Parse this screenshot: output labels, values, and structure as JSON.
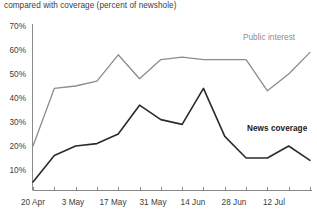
{
  "subtitle": "compared with coverage (percent of newshole)",
  "colors": {
    "public_interest": "#8c8c8c",
    "news_coverage": "#2b2b2b",
    "axis": "#8a8a8a",
    "text": "#3d3d3d"
  },
  "labels": {
    "public_interest": "Public interest",
    "news_coverage": "News coverage"
  },
  "y_ticks": [
    "70%",
    "60%",
    "50%",
    "40%",
    "30%",
    "20%",
    "10%"
  ],
  "x_ticks": [
    "20 Apr",
    "3 May",
    "17 May",
    "31 May",
    "14 Jun",
    "28 Jun",
    "12 Jul"
  ],
  "chart_data": {
    "type": "line",
    "title": "",
    "subtitle": "compared with coverage (percent of newshole)",
    "xlabel": "",
    "ylabel": "",
    "ylim": [
      0,
      70
    ],
    "yticks": [
      10,
      20,
      30,
      40,
      50,
      60,
      70
    ],
    "ytick_labels": [
      "10%",
      "20%",
      "30%",
      "40%",
      "50%",
      "60%",
      "70%"
    ],
    "grid": false,
    "legend": "inline-annotations",
    "x": [
      "20 Apr",
      "27 Apr",
      "3 May",
      "10 May",
      "17 May",
      "24 May",
      "31 May",
      "7 Jun",
      "14 Jun",
      "21 Jun",
      "28 Jun",
      "5 Jul",
      "12 Jul",
      "19 Jul"
    ],
    "xtick_labels": [
      "20 Apr",
      "3 May",
      "17 May",
      "31 May",
      "14 Jun",
      "28 Jun",
      "12 Jul"
    ],
    "series": [
      {
        "name": "Public interest",
        "color": "#8c8c8c",
        "values": [
          20,
          44,
          45,
          47,
          58,
          48,
          56,
          57,
          56,
          56,
          56,
          43,
          50,
          59
        ]
      },
      {
        "name": "News coverage",
        "color": "#2b2b2b",
        "values": [
          5,
          16,
          20,
          21,
          25,
          37,
          31,
          29,
          44,
          24,
          15,
          15,
          20,
          14
        ]
      }
    ]
  }
}
